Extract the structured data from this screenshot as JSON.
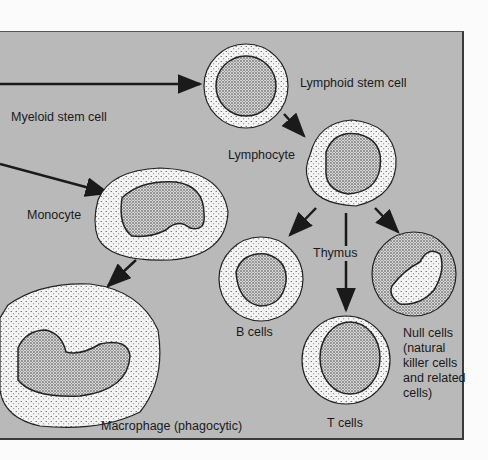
{
  "diagram": {
    "colors": {
      "panel": "#b9b9b9",
      "cell_fill": "#f4f4f4",
      "ink": "#1a1a1a"
    },
    "labels": {
      "lymphoid_stem_cell": "Lymphoid stem cell",
      "myeloid_stem_cell": "Myeloid stem cell",
      "lymphocyte": "Lymphocyte",
      "monocyte": "Monocyte",
      "thymus": "Thymus",
      "b_cells": "B cells",
      "t_cells": "T cells",
      "null_cells": "Null cells (natural killer cells and related cells)",
      "macrophage": "Macrophage (phagocytic)"
    },
    "edges": [
      {
        "from": "offscreen",
        "to": "lymphoid_stem_cell"
      },
      {
        "from": "lymphoid_stem_cell",
        "to": "lymphocyte"
      },
      {
        "from": "offscreen",
        "to": "monocyte"
      },
      {
        "from": "monocyte",
        "to": "macrophage"
      },
      {
        "from": "lymphocyte",
        "to": "b_cells"
      },
      {
        "from": "lymphocyte",
        "to": "t_cells",
        "via": "thymus"
      },
      {
        "from": "lymphocyte",
        "to": "null_cells"
      }
    ]
  }
}
